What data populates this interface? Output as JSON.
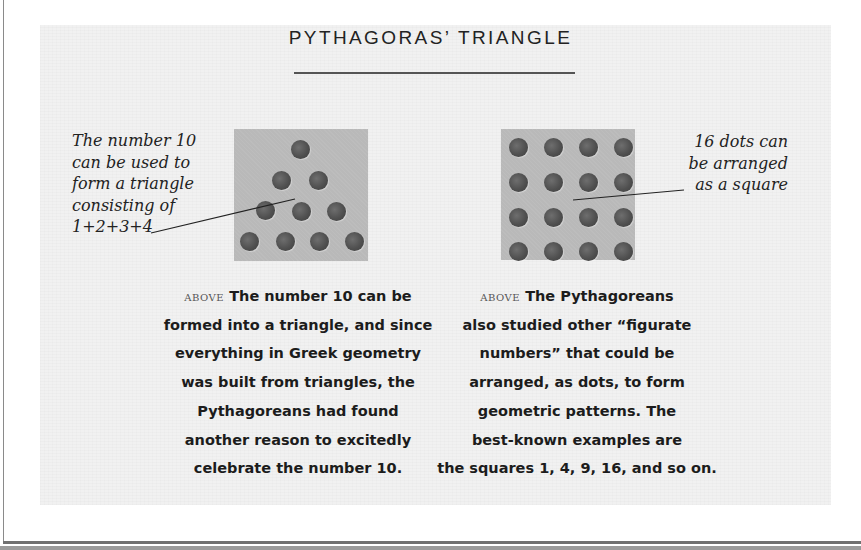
{
  "title": "PYTHAGORAS’ TRIANGLE",
  "annotations": {
    "left": [
      "The number 10",
      "can be used to",
      "form a triangle",
      "consisting of",
      "1+2+3+4"
    ],
    "right": [
      "16 dots can",
      "be arranged",
      "as a square"
    ]
  },
  "figures": {
    "triangle": {
      "label": "triangular number 10",
      "rows": [
        1,
        2,
        3,
        4
      ],
      "total": 10
    },
    "square": {
      "label": "square number 16",
      "rows": [
        4,
        4,
        4,
        4
      ],
      "total": 16
    }
  },
  "captions": {
    "left": {
      "kicker": "above",
      "lines": [
        "The number 10 can be",
        "formed into a triangle, and since",
        "everything in Greek geometry",
        "was built from triangles, the",
        "Pythagoreans had found",
        "another reason to excitedly",
        "celebrate the number 10."
      ]
    },
    "right": {
      "kicker": "above",
      "lines": [
        "The Pythagoreans",
        "also studied other “figurate",
        "numbers” that could be",
        "arranged, as dots, to form",
        "geometric patterns. The",
        "best-known examples are",
        "the squares 1, 4, 9, 16, and so on."
      ]
    }
  },
  "colors": {
    "panel": "#f1f1f1",
    "figure_bg": "#b9b9b9",
    "dot": "#505050",
    "text": "#222222"
  }
}
